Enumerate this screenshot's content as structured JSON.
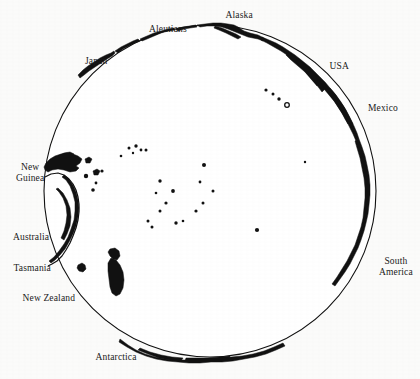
{
  "figure": {
    "name": "pacific-ocean-globe-map",
    "projection": "orthographic-pacific-centered",
    "background_color": "#fbfbfa",
    "ink_color": "#111111"
  },
  "globe": {
    "center_x": 210,
    "center_y": 191,
    "radius": 166,
    "outline_color": "#111111",
    "outline_width": 1.1,
    "fill_color": "#ffffff"
  },
  "labels": [
    {
      "id": "alaska",
      "text": "Alaska",
      "x": 239,
      "y": 10,
      "align": "center"
    },
    {
      "id": "aleutians",
      "text": "Aleutians",
      "x": 168,
      "y": 24,
      "align": "center"
    },
    {
      "id": "japan",
      "text": "Japan",
      "x": 96,
      "y": 56,
      "align": "center"
    },
    {
      "id": "usa",
      "text": "USA",
      "x": 339,
      "y": 61,
      "align": "center"
    },
    {
      "id": "mexico",
      "text": "Mexico",
      "x": 383,
      "y": 103,
      "align": "center"
    },
    {
      "id": "new-guinea",
      "text": "New\nGuinea",
      "x": 30,
      "y": 162,
      "align": "center"
    },
    {
      "id": "australia",
      "text": "Australia",
      "x": 31,
      "y": 232,
      "align": "center"
    },
    {
      "id": "tasmania",
      "text": "Tasmania",
      "x": 32,
      "y": 263,
      "align": "center"
    },
    {
      "id": "new-zealand",
      "text": "New Zealand",
      "x": 49,
      "y": 293,
      "align": "center"
    },
    {
      "id": "south-america",
      "text": "South\nAmerica",
      "x": 396,
      "y": 256,
      "align": "center"
    },
    {
      "id": "antarctica",
      "text": "Antarctica",
      "x": 116,
      "y": 352,
      "align": "center"
    }
  ],
  "landmasses": [
    {
      "id": "japan-arc",
      "name": "Japan"
    },
    {
      "id": "kuril-arc",
      "name": "Kuril Islands"
    },
    {
      "id": "aleutian-arc",
      "name": "Aleutian Islands"
    },
    {
      "id": "alaska-coast",
      "name": "Alaska"
    },
    {
      "id": "north-america",
      "name": "North America west coast"
    },
    {
      "id": "mexico-coast",
      "name": "Mexico / Baja California"
    },
    {
      "id": "south-america",
      "name": "South America west coast"
    },
    {
      "id": "new-guinea",
      "name": "New Guinea"
    },
    {
      "id": "australia",
      "name": "Australia"
    },
    {
      "id": "tasmania",
      "name": "Tasmania"
    },
    {
      "id": "new-zealand",
      "name": "New Zealand"
    },
    {
      "id": "antarctica",
      "name": "Antarctica"
    },
    {
      "id": "hawaii-chain",
      "name": "Hawaiian Islands"
    },
    {
      "id": "pacific-islets",
      "name": "Pacific island groups"
    }
  ],
  "island_dots": [
    {
      "x": 266,
      "y": 90,
      "r": 1.6
    },
    {
      "x": 273,
      "y": 94,
      "r": 1.5
    },
    {
      "x": 279,
      "y": 99,
      "r": 1.7
    },
    {
      "x": 287,
      "y": 105,
      "r": 2.3,
      "ring": true
    },
    {
      "x": 129,
      "y": 148,
      "r": 1.5
    },
    {
      "x": 136,
      "y": 146,
      "r": 1.7
    },
    {
      "x": 141,
      "y": 150,
      "r": 1.4
    },
    {
      "x": 146,
      "y": 150,
      "r": 1.5
    },
    {
      "x": 121,
      "y": 156,
      "r": 1.3
    },
    {
      "x": 133,
      "y": 153,
      "r": 1.2
    },
    {
      "x": 102,
      "y": 171,
      "r": 1.6
    },
    {
      "x": 96,
      "y": 183,
      "r": 1.4
    },
    {
      "x": 204,
      "y": 165,
      "r": 2.0
    },
    {
      "x": 160,
      "y": 181,
      "r": 1.7
    },
    {
      "x": 200,
      "y": 182,
      "r": 1.4
    },
    {
      "x": 156,
      "y": 193,
      "r": 1.3
    },
    {
      "x": 173,
      "y": 191,
      "r": 1.9
    },
    {
      "x": 213,
      "y": 191,
      "r": 1.5
    },
    {
      "x": 305,
      "y": 162,
      "r": 1.2
    },
    {
      "x": 166,
      "y": 203,
      "r": 1.6
    },
    {
      "x": 203,
      "y": 203,
      "r": 1.5
    },
    {
      "x": 160,
      "y": 211,
      "r": 1.5
    },
    {
      "x": 196,
      "y": 211,
      "r": 1.6
    },
    {
      "x": 148,
      "y": 221,
      "r": 1.5
    },
    {
      "x": 152,
      "y": 227,
      "r": 1.5
    },
    {
      "x": 176,
      "y": 223,
      "r": 1.7
    },
    {
      "x": 183,
      "y": 221,
      "r": 1.3
    },
    {
      "x": 257,
      "y": 230,
      "r": 2.1
    },
    {
      "x": 86,
      "y": 176,
      "r": 2.2
    },
    {
      "x": 93,
      "y": 190,
      "r": 1.8
    }
  ]
}
